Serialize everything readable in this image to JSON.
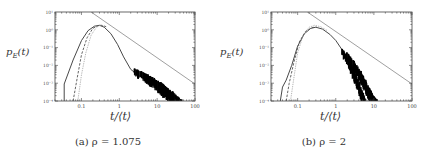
{
  "figure": {
    "panels": [
      {
        "id": "a",
        "caption": "(a) ρ = 1.075",
        "ylabel": "p_E(t)",
        "ylabel_display": "pE(t)",
        "xlabel": "t/⟨t⟩"
      },
      {
        "id": "b",
        "caption": "(b) ρ = 2",
        "ylabel": "p_E(t)",
        "ylabel_display": "pE(t)",
        "xlabel": "t/⟨t⟩"
      }
    ]
  },
  "chart_data": [
    {
      "type": "line",
      "title": "(a) ρ = 1.075",
      "xlabel": "t/⟨t⟩",
      "ylabel": "p_E(t)",
      "xscale": "log",
      "yscale": "log",
      "xlim": [
        0.02,
        100
      ],
      "ylim": [
        0.0001,
        10
      ],
      "xticks": [
        0.1,
        1,
        10,
        100
      ],
      "xtick_labels": [
        "0.1",
        "1",
        "10",
        "100"
      ],
      "yticks": [
        0.0001,
        0.001,
        0.01,
        0.1,
        1,
        10
      ],
      "ytick_labels": [
        "10⁻⁴",
        "10⁻³",
        "10⁻²",
        "10⁻¹",
        "10⁰",
        "10¹"
      ],
      "grid": false,
      "series": [
        {
          "name": "solid",
          "style": "solid",
          "color": "#333333",
          "x": [
            0.035,
            0.035,
            0.06,
            0.1,
            0.15,
            0.22,
            0.3,
            0.4,
            0.6,
            0.9,
            1.3,
            2,
            3,
            4,
            6,
            9,
            14,
            20,
            30
          ],
          "y": [
            0.0001,
            0.0009,
            0.02,
            0.25,
            0.9,
            1.6,
            1.8,
            1.4,
            0.6,
            0.15,
            0.03,
            0.006,
            0.003,
            0.002,
            0.0012,
            0.0007,
            0.0004,
            0.0002,
            0.0001
          ]
        },
        {
          "name": "dashed",
          "style": "dashed",
          "color": "#555555",
          "x": [
            0.06,
            0.08,
            0.1,
            0.14,
            0.2,
            0.28,
            0.35,
            0.45
          ],
          "y": [
            0.0001,
            0.003,
            0.04,
            0.35,
            1.2,
            1.75,
            1.8,
            1.5
          ]
        },
        {
          "name": "dotted",
          "style": "dotted",
          "color": "#999999",
          "x": [
            0.08,
            0.1,
            0.13,
            0.18,
            0.25,
            0.32,
            0.42
          ],
          "y": [
            0.0001,
            0.003,
            0.05,
            0.5,
            1.4,
            1.8,
            1.55
          ]
        },
        {
          "name": "noisy-tail",
          "style": "noise",
          "color": "#000000",
          "x": [
            2.5,
            4,
            6,
            9,
            13,
            18,
            25,
            35,
            45
          ],
          "y_hi": [
            0.006,
            0.004,
            0.0025,
            0.0015,
            0.0009,
            0.0005,
            0.0003,
            0.00015,
            0.0001
          ],
          "y_lo": [
            0.004,
            0.0022,
            0.0012,
            0.0006,
            0.0003,
            0.00015,
            0.0001,
            0.0001,
            0.0001
          ]
        },
        {
          "name": "power-law-reference",
          "style": "solid-thin",
          "color": "#888888",
          "x": [
            0.18,
            100
          ],
          "y": [
            10,
            0.0009
          ]
        }
      ]
    },
    {
      "type": "line",
      "title": "(b) ρ = 2",
      "xlabel": "t/⟨t⟩",
      "ylabel": "p_E(t)",
      "xscale": "log",
      "yscale": "log",
      "xlim": [
        0.02,
        100
      ],
      "ylim": [
        0.0001,
        10
      ],
      "xticks": [
        0.1,
        1,
        10,
        100
      ],
      "xtick_labels": [
        "0.1",
        "1",
        "10",
        "100"
      ],
      "yticks": [
        0.0001,
        0.001,
        0.01,
        0.1,
        1,
        10
      ],
      "ytick_labels": [
        "10⁻⁴",
        "10⁻³",
        "10⁻²",
        "10⁻¹",
        "10⁰",
        "10¹"
      ],
      "grid": false,
      "series": [
        {
          "name": "solid",
          "style": "solid",
          "color": "#333333",
          "x": [
            0.035,
            0.04,
            0.05,
            0.07,
            0.1,
            0.15,
            0.22,
            0.3,
            0.45,
            0.7,
            1,
            1.5,
            2.2,
            3,
            4,
            5
          ],
          "y": [
            0.0001,
            0.0006,
            0.0015,
            0.01,
            0.12,
            0.6,
            1.2,
            1.4,
            1.1,
            0.55,
            0.25,
            0.07,
            0.015,
            0.003,
            0.0006,
            0.0001
          ]
        },
        {
          "name": "dashed",
          "style": "dashed",
          "color": "#555555",
          "x": [
            0.05,
            0.06,
            0.08,
            0.11,
            0.16,
            0.24,
            0.32
          ],
          "y": [
            0.0001,
            0.001,
            0.015,
            0.2,
            0.8,
            1.35,
            1.4
          ]
        },
        {
          "name": "dotted",
          "style": "dotted",
          "color": "#999999",
          "x": [
            0.065,
            0.08,
            0.1,
            0.14,
            0.2,
            0.28,
            0.4,
            0.6
          ],
          "y": [
            0.0001,
            0.002,
            0.05,
            0.5,
            1.4,
            1.8,
            1.5,
            0.9
          ]
        },
        {
          "name": "noisy-tail-1",
          "style": "noise",
          "color": "#000000",
          "x": [
            1.5,
            2.2,
            3,
            4,
            5,
            6
          ],
          "y_hi": [
            0.08,
            0.02,
            0.005,
            0.001,
            0.0003,
            0.0001
          ],
          "y_lo": [
            0.05,
            0.01,
            0.002,
            0.0004,
            0.0001,
            0.0001
          ]
        },
        {
          "name": "noisy-tail-2",
          "style": "noise",
          "color": "#000000",
          "x": [
            2,
            3,
            4.5,
            6,
            8,
            10,
            12
          ],
          "y_hi": [
            0.05,
            0.015,
            0.004,
            0.0012,
            0.0004,
            0.00015,
            0.0001
          ],
          "y_lo": [
            0.03,
            0.007,
            0.0015,
            0.0004,
            0.00012,
            0.0001,
            0.0001
          ]
        },
        {
          "name": "power-law-reference",
          "style": "solid-thin",
          "color": "#888888",
          "x": [
            0.18,
            100
          ],
          "y": [
            10,
            0.0009
          ]
        }
      ]
    }
  ]
}
